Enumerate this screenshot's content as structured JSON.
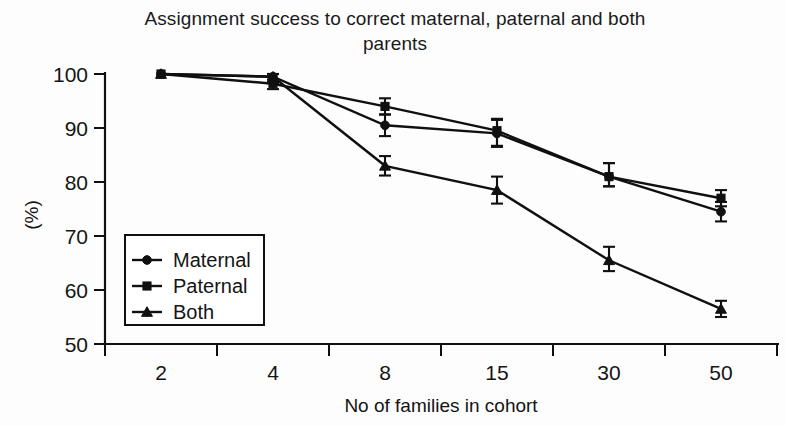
{
  "chart_data": {
    "type": "line",
    "title": "Assignment success to correct maternal, paternal and both parents",
    "xlabel": "No of families in cohort",
    "ylabel": "(%)",
    "categories": [
      "2",
      "4",
      "8",
      "15",
      "30",
      "50"
    ],
    "xlim": [
      0,
      6
    ],
    "ylim": [
      50,
      100
    ],
    "yticks": [
      "50",
      "60",
      "70",
      "80",
      "90",
      "100"
    ],
    "grid": false,
    "legend_position": "inside-left-lower",
    "series": [
      {
        "name": "Maternal",
        "marker": "circle",
        "values": [
          100,
          99.5,
          90.5,
          89,
          81,
          74.5
        ],
        "err_low": [
          0,
          1.2,
          2.0,
          2.5,
          1.8,
          1.8
        ],
        "err_high": [
          0,
          0.5,
          2.0,
          2.5,
          2.5,
          1.8
        ]
      },
      {
        "name": "Paternal",
        "marker": "square",
        "values": [
          100,
          98.2,
          94,
          89.5,
          81,
          77
        ],
        "err_low": [
          0,
          1.0,
          1.5,
          2.8,
          1.8,
          1.5
        ],
        "err_high": [
          0,
          0.8,
          1.5,
          2.2,
          2.5,
          1.5
        ]
      },
      {
        "name": "Both",
        "marker": "triangle",
        "values": [
          100,
          99.5,
          83,
          78.5,
          65.5,
          56.5
        ],
        "err_low": [
          0,
          1.0,
          1.8,
          2.5,
          2.0,
          1.5
        ],
        "err_high": [
          0,
          0.5,
          1.8,
          2.5,
          2.5,
          1.5
        ]
      }
    ],
    "colors": {
      "ink": "#101010",
      "background": "#fdfdfd"
    }
  },
  "axis": {
    "y_tick_labels": [
      "100",
      "90",
      "80",
      "70",
      "60",
      "50"
    ],
    "x_tick_labels": [
      "2",
      "4",
      "8",
      "15",
      "30",
      "50"
    ],
    "y_axis_title": "(%)",
    "x_axis_title": "No of families in cohort"
  },
  "legend": {
    "entries": [
      {
        "label": "Maternal",
        "marker": "circle"
      },
      {
        "label": "Paternal",
        "marker": "square"
      },
      {
        "label": "Both",
        "marker": "triangle"
      }
    ]
  }
}
